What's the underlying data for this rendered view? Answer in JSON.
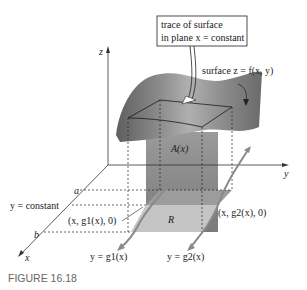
{
  "figure": {
    "caption": "FIGURE 16.18",
    "callout": {
      "line1": "trace of surface",
      "line2": "in plane x = constant"
    },
    "labels": {
      "surface": "surface z = f(x, y)",
      "area": "A(x)",
      "region": "R",
      "z_axis": "z",
      "y_axis": "y",
      "x_axis": "x",
      "a": "a",
      "b": "b",
      "y_constant": "y = constant",
      "point1": "(x, g1(x), 0)",
      "point2": "(x, g2(x), 0)",
      "curve1": "y = g1(x)",
      "curve2": "y = g2(x)"
    },
    "colors": {
      "surface_dark": "#6e6e6e",
      "surface_light": "#b5b5b5",
      "slab": "#8a8a8a",
      "region": "#c8c8c8",
      "curve": "#8f8f8f",
      "axis": "#333333",
      "caption": "#666666"
    }
  }
}
